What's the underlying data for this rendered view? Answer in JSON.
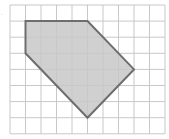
{
  "diagram": {
    "type": "grid-polygon",
    "grid": {
      "columns": 10,
      "rows": 8,
      "origin_px": [
        10,
        5
      ],
      "cell_w": 15.5,
      "cell_h": 16.1,
      "line_color": "#c8c8c8"
    },
    "polygon": {
      "vertices": [
        [
          1,
          1
        ],
        [
          5,
          1
        ],
        [
          8,
          4
        ],
        [
          5,
          7
        ],
        [
          1,
          3
        ]
      ],
      "fill": "#c8c8c8",
      "stroke": "#6e6e6e",
      "stroke_width": 2
    },
    "corner_mark": "."
  }
}
